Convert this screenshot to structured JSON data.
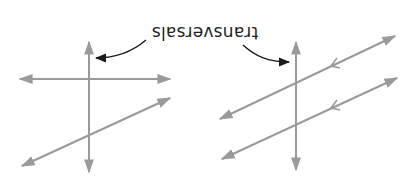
{
  "label": {
    "text": "transversals",
    "orientation": "rotated-180"
  },
  "colors": {
    "line": "#9a9a9a",
    "callout": "#1a1a1a",
    "text": "#1f1f1f",
    "background": "#ffffff"
  },
  "diagrams": [
    {
      "id": "non-parallel",
      "description": "Transversal crossing two non-parallel lines",
      "transversal": {
        "x1": 89,
        "y1": 42,
        "x2": 89,
        "y2": 172
      },
      "lines": [
        {
          "x1": 20,
          "y1": 79,
          "x2": 170,
          "y2": 79
        },
        {
          "x1": 22,
          "y1": 166,
          "x2": 170,
          "y2": 98
        }
      ],
      "parallel_marks": false
    },
    {
      "id": "parallel",
      "description": "Transversal crossing two parallel lines",
      "transversal": {
        "x1": 296,
        "y1": 42,
        "x2": 296,
        "y2": 170
      },
      "lines": [
        {
          "x1": 220,
          "y1": 119,
          "x2": 395,
          "y2": 36
        },
        {
          "x1": 222,
          "y1": 159,
          "x2": 397,
          "y2": 78
        }
      ],
      "parallel_marks": true
    }
  ]
}
